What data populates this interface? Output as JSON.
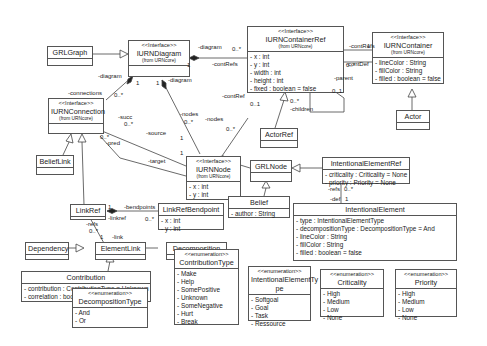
{
  "classes": {
    "grlgraph": {
      "name": "GRLGraph"
    },
    "iurndiagram": {
      "stereo": "<<Interface>>",
      "name": "IURNDiagram",
      "from": "(from URNcore)"
    },
    "iurncontainerref": {
      "stereo": "<<Interface>>",
      "name": "IURNContainerRef",
      "from": "(from URNcore)",
      "attrs": [
        "- x : int",
        "- y : int",
        "- width : int",
        "- height : int",
        "- fixed : boolean = false"
      ]
    },
    "iurncontainer": {
      "stereo": "<<Interface>>",
      "name": "IURNContainer",
      "from": "(from URNcore)",
      "attrs": [
        "- lineColor : String",
        "- fillColor : String",
        "- filled : boolean = false"
      ]
    },
    "actor": {
      "name": "Actor"
    },
    "actorref": {
      "name": "ActorRef"
    },
    "iurnconnection": {
      "stereo": "<<Interface>>",
      "name": "IURNConnection",
      "from": "(from URNcore)"
    },
    "iurnnode": {
      "stereo": "<<Interface>>",
      "name": "IURNNode",
      "from": "(from URNcore)",
      "attrs": [
        "- x : int",
        "- y : int"
      ]
    },
    "beliefLink": {
      "name": "BeliefLink"
    },
    "grlnode": {
      "name": "GRLNode"
    },
    "belief": {
      "name": "Belief",
      "attrs": [
        "- author : String"
      ]
    },
    "intentionalelementref": {
      "name": "IntentionalElementRef",
      "attrs": [
        "- criticality : Criticality = None",
        "- priority : Priority = None"
      ]
    },
    "linkref": {
      "name": "LinkRef"
    },
    "linkrefbendpoint": {
      "name": "LinkRefBendpoint",
      "attrs": [
        "- x : int",
        "- y : int"
      ]
    },
    "intentionalelement": {
      "name": "IntentionalElement",
      "attrs": [
        "- type : IntentionalElementType",
        "- decompositionType : DecompositionType = And",
        "- lineColor : String",
        "- fillColor : String",
        "- filled : boolean = false"
      ]
    },
    "dependency": {
      "name": "Dependency"
    },
    "elementlink": {
      "name": "ElementLink"
    },
    "decomposition": {
      "name": "Decomposition"
    },
    "contribution": {
      "name": "Contribution",
      "attrs": [
        "- contribution : ContributionType = Unknown",
        "- correlation : boolean = false"
      ]
    },
    "contributiontype": {
      "stereo": "<<enumeration>>",
      "name": "ContributionType",
      "attrs": [
        "- Make",
        "- Help",
        "- SomePositive",
        "- Unknown",
        "- SomeNegative",
        "- Hurt",
        "- Break"
      ]
    },
    "decompositiontype": {
      "stereo": "<<enumeration>>",
      "name": "DecompositionType",
      "attrs": [
        "- And",
        "- Or"
      ]
    },
    "intentionalelementtype": {
      "stereo": "<<enumeration>>",
      "name1": "IntentionalElementTy",
      "name2": "pe",
      "attrs": [
        "- Softgoal",
        "- Goal",
        "- Task",
        "- Ressource"
      ]
    },
    "criticality": {
      "stereo": "<<enumeration>>",
      "name": "Criticality",
      "attrs": [
        "- High",
        "- Medium",
        "- Low",
        "- None"
      ]
    },
    "priority": {
      "stereo": "<<enumeration>>",
      "name": "Priority",
      "attrs": [
        "- High",
        "- Medium",
        "- Low",
        "- None"
      ]
    }
  },
  "labels": {
    "diag_top": "-diagram",
    "m_0n_a": "0..*",
    "contRefs_a": "-contRefs",
    "one_a": "1",
    "contRefs_b": "-contRefs",
    "one_b": "1",
    "m_0n_b": "0..*",
    "contDef": "-contDef",
    "parent": "-parent",
    "m_01_a": "0..1",
    "m_0n_c": "0..*",
    "children": "-children",
    "contRef": "-contRef",
    "m_01_b": "0..1",
    "nodes_b": "-nodes",
    "m_0n_d": "0..*",
    "diag_left": "-diagram",
    "one_c": "1",
    "one_d": "1",
    "diag_mid": "-diagram",
    "connections": "-connections",
    "m_0n_e": "0..*",
    "nodes": "-nodes",
    "m_0n_f": "0..*",
    "succ": "-succ",
    "m_0n_g": "0..*",
    "source": "-source",
    "one_e": "1",
    "pred": "-pred",
    "m_0n_h": "0..*",
    "target": "-target",
    "one_f": "1",
    "bendpoints": "-bendpoints",
    "one_g": "1",
    "linkref": "-linkref",
    "m_0n_i": "0..*",
    "refs_a": "-refs",
    "m_0n_j": "0..*",
    "link": "-link",
    "one_h": "1",
    "refs_b": "-refs",
    "m_0n_k": "0..*",
    "def": "-def",
    "one_i": "1"
  }
}
